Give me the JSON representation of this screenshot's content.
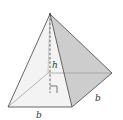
{
  "diagram": {
    "type": "square-pyramid",
    "labels": {
      "height": "h",
      "base_front": "b",
      "base_side": "b"
    },
    "colors": {
      "edge": "#555555",
      "hidden_edge": "#888888",
      "front_face": "#f4f4f4",
      "right_face": "#cfcfcf",
      "base": "#ebebeb"
    }
  }
}
